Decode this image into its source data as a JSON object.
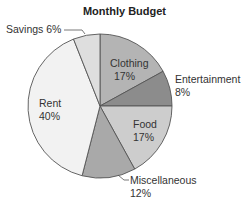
{
  "chart_data": {
    "type": "pie",
    "title": "Monthly Budget",
    "start_angle_deg": 0,
    "direction": "clockwise",
    "slices": [
      {
        "label": "Clothing",
        "value": 17,
        "pct_label": "17%",
        "color": "#b4b4b4"
      },
      {
        "label": "Entertainment",
        "value": 8,
        "pct_label": "8%",
        "color": "#8c8c8c"
      },
      {
        "label": "Food",
        "value": 17,
        "pct_label": "17%",
        "color": "#cdcdcd"
      },
      {
        "label": "Miscellaneous",
        "value": 12,
        "pct_label": "12%",
        "color": "#a9a9a9"
      },
      {
        "label": "Rent",
        "value": 40,
        "pct_label": "40%",
        "color": "#f2f2f2"
      },
      {
        "label": "Savings",
        "value": 6,
        "pct_label": "6%",
        "color": "#dedede"
      }
    ],
    "categories": [
      "Clothing",
      "Entertainment",
      "Food",
      "Miscellaneous",
      "Rent",
      "Savings"
    ],
    "values": [
      17,
      8,
      17,
      12,
      40,
      6
    ],
    "legend": "none (direct labels)",
    "outside_labels": {
      "savings": "Savings 6%",
      "entertainment_name": "Entertainment",
      "entertainment_pct": "8%",
      "misc_name": "Miscellaneous",
      "misc_pct": "12%"
    }
  }
}
